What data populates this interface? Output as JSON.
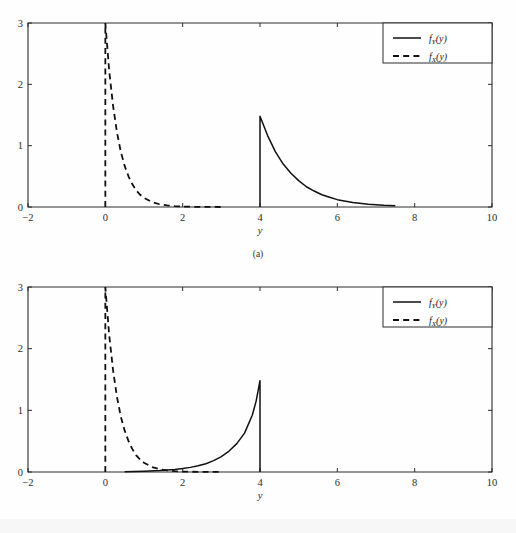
{
  "page": {
    "background": "#ffffff",
    "ink_color": "#111111"
  },
  "figures": [
    {
      "id": "a",
      "caption": "(a)",
      "axis": {
        "xlabel": "y",
        "ylabel": "",
        "xlim": [
          -2,
          10
        ],
        "ylim": [
          0,
          3
        ],
        "xticks": [
          -2,
          0,
          2,
          4,
          6,
          8,
          10
        ],
        "xticklabels": [
          "−2",
          "0",
          "2",
          "4",
          "6",
          "8",
          "10"
        ],
        "yticks": [
          0,
          1,
          2,
          3
        ],
        "yticklabels": [
          "0",
          "1",
          "2",
          "3"
        ],
        "grid": false,
        "tick_direction": "in"
      },
      "legend": {
        "position": "top-right",
        "entries": [
          {
            "label": "f (y)",
            "fn": "f",
            "sub": "Y",
            "arg": "(y)",
            "style": "solid"
          },
          {
            "label": "f (y)",
            "fn": "f",
            "sub": "X",
            "arg": "(y)",
            "style": "dashed"
          }
        ]
      },
      "chart_data": {
        "type": "line",
        "title": "",
        "xlabel": "y",
        "ylabel": "",
        "xlim": [
          -2,
          10
        ],
        "ylim": [
          0,
          3
        ],
        "grid": false,
        "series": [
          {
            "name": "f_X(y)",
            "style": "dashed",
            "comment": "Exponential density, vertical rise at y=0 then decay exp(-3y)*3",
            "x": [
              0,
              0,
              0.1,
              0.2,
              0.3,
              0.4,
              0.5,
              0.6,
              0.7,
              0.8,
              0.9,
              1.0,
              1.2,
              1.4,
              1.6,
              1.8,
              2.0,
              2.4,
              3.0
            ],
            "y": [
              0,
              3.0,
              2.22,
              1.65,
              1.22,
              0.9,
              0.67,
              0.5,
              0.37,
              0.27,
              0.2,
              0.15,
              0.082,
              0.045,
              0.025,
              0.014,
              0.007,
              0.002,
              0.0004
            ]
          },
          {
            "name": "f_Y(y)",
            "style": "solid",
            "comment": "Jump at y=4 to 1.48 then exponential decay, flat ~0 past y=6, ends 7.5",
            "x": [
              4,
              4,
              4.2,
              4.4,
              4.6,
              4.8,
              5.0,
              5.2,
              5.4,
              5.6,
              5.8,
              6.0,
              6.4,
              6.8,
              7.2,
              7.5
            ],
            "y": [
              0,
              1.48,
              1.16,
              0.9,
              0.7,
              0.55,
              0.43,
              0.33,
              0.26,
              0.2,
              0.16,
              0.12,
              0.073,
              0.044,
              0.027,
              0.019
            ]
          }
        ]
      }
    },
    {
      "id": "b",
      "caption": "",
      "axis": {
        "xlabel": "y",
        "ylabel": "",
        "xlim": [
          -2,
          10
        ],
        "ylim": [
          0,
          3
        ],
        "xticks": [
          -2,
          0,
          2,
          4,
          6,
          8,
          10
        ],
        "xticklabels": [
          "−2",
          "0",
          "2",
          "4",
          "6",
          "8",
          "10"
        ],
        "yticks": [
          0,
          1,
          2,
          3
        ],
        "yticklabels": [
          "0",
          "1",
          "2",
          "3"
        ],
        "grid": false,
        "tick_direction": "in"
      },
      "legend": {
        "position": "top-right",
        "entries": [
          {
            "label": "f (y)",
            "fn": "f",
            "sub": "Y",
            "arg": "(y)",
            "style": "solid"
          },
          {
            "label": "f (y)",
            "fn": "f",
            "sub": "X",
            "arg": "(y)",
            "style": "dashed"
          }
        ]
      },
      "chart_data": {
        "type": "line",
        "title": "",
        "xlabel": "y",
        "ylabel": "",
        "xlim": [
          -2,
          10
        ],
        "ylim": [
          0,
          3
        ],
        "grid": false,
        "series": [
          {
            "name": "f_X(y)",
            "style": "dashed",
            "comment": "Same exponential density as in (a)",
            "x": [
              0,
              0,
              0.1,
              0.2,
              0.3,
              0.4,
              0.5,
              0.6,
              0.7,
              0.8,
              0.9,
              1.0,
              1.2,
              1.4,
              1.6,
              1.8,
              2.0,
              2.4,
              3.0
            ],
            "y": [
              0,
              3.0,
              2.22,
              1.65,
              1.22,
              0.9,
              0.67,
              0.5,
              0.37,
              0.27,
              0.2,
              0.15,
              0.082,
              0.045,
              0.025,
              0.014,
              0.007,
              0.002,
              0.0004
            ]
          },
          {
            "name": "f_Y(y)",
            "style": "solid",
            "comment": "Rises from ~0 near y=0.5 increasing to peak 1.48 at y=4, then vertical drop to 0",
            "x": [
              0.5,
              1.0,
              1.4,
              1.8,
              2.0,
              2.2,
              2.4,
              2.6,
              2.8,
              3.0,
              3.2,
              3.4,
              3.6,
              3.8,
              3.9,
              4.0,
              4.0
            ],
            "y": [
              0.003,
              0.012,
              0.023,
              0.041,
              0.055,
              0.075,
              0.1,
              0.135,
              0.185,
              0.25,
              0.34,
              0.46,
              0.63,
              0.92,
              1.15,
              1.48,
              0
            ]
          }
        ]
      }
    }
  ]
}
